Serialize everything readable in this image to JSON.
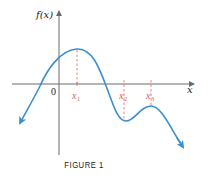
{
  "figure": {
    "caption": "FIGURE 1",
    "y_axis_label": "f(x)",
    "x_axis_label": "x",
    "origin_label": "0",
    "points": [
      {
        "label": "x",
        "sub": "1",
        "kind": "local maximum"
      },
      {
        "label": "x",
        "sub": "2",
        "kind": "local minimum"
      },
      {
        "label": "x",
        "sub": "3",
        "kind": "local maximum"
      }
    ],
    "colors": {
      "curve": "#3a8fd0",
      "axes": "#6b6b6b",
      "guides": "#e57373"
    }
  }
}
